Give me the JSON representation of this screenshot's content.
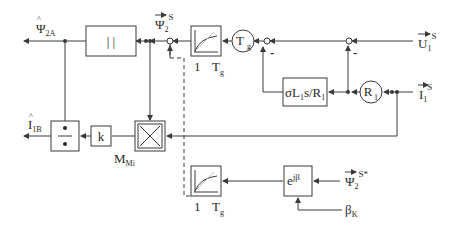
{
  "diagram": {
    "type": "control block diagram",
    "outputs": {
      "psi_hat": {
        "symbol": "Ψ",
        "hat": true,
        "subscript": "2A"
      },
      "i_hat": {
        "symbol": "I",
        "hat": true,
        "subscript": "1B"
      }
    },
    "inputs": {
      "u1": {
        "symbol": "U",
        "subscript": "1",
        "superscript": "S",
        "vector": true
      },
      "i1": {
        "symbol": "I",
        "subscript": "1",
        "superscript": "S",
        "vector": true
      },
      "psi2_ref": {
        "symbol": "Ψ",
        "subscript": "2",
        "superscript": "S*",
        "vector": true
      },
      "beta": {
        "symbol": "β",
        "subscript": "K"
      }
    },
    "signals": {
      "psi2": {
        "symbol": "Ψ",
        "subscript": "2",
        "superscript": "S",
        "vector": true
      },
      "torque": {
        "symbol": "M",
        "subscript": "Mi"
      }
    },
    "blocks": {
      "abs": {
        "label": "| |"
      },
      "divide": {
        "label": "÷"
      },
      "gain_k": {
        "label": "k"
      },
      "cross_product": {
        "label": "×"
      },
      "lowpass_top": {
        "label_left": "1",
        "label_right": "T",
        "label_right_sub": "g"
      },
      "lowpass_bottom": {
        "label_left": "1",
        "label_right": "T",
        "label_right_sub": "g"
      },
      "tg_circle": {
        "label": "T",
        "sub": "g"
      },
      "r1_circle": {
        "label": "R",
        "sub": "1"
      },
      "sigma_block": {
        "label": "σL",
        "sub1": "1",
        "mid": "s/R",
        "sub2": "1"
      },
      "rotation": {
        "label": "e",
        "sup": "jβ",
        "sup_sub": "K"
      }
    },
    "signs": {
      "sum_tg": "-",
      "sum_u": "-"
    }
  }
}
